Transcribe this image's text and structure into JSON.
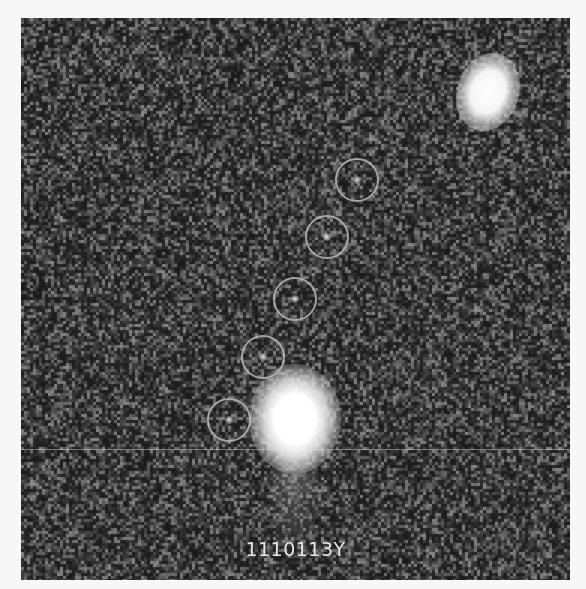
{
  "image": {
    "description": "Astronomical survey cutout showing a faint moving object tracked across five exposures, marked with circles, near a bright star",
    "label": "1110113Y",
    "background_color": "#2a2a2a",
    "border_color": "#f7f7f7",
    "marker_color": "#b9b9b9"
  },
  "markers": [
    {
      "index": 1,
      "cx": 336,
      "cy": 162,
      "r": 22
    },
    {
      "index": 2,
      "cx": 306,
      "cy": 219,
      "r": 22
    },
    {
      "index": 3,
      "cx": 274,
      "cy": 281,
      "r": 22
    },
    {
      "index": 4,
      "cx": 242,
      "cy": 339,
      "r": 22
    },
    {
      "index": 5,
      "cx": 208,
      "cy": 402,
      "r": 22
    }
  ],
  "bright_sources": [
    {
      "name": "bright-star",
      "cx": 274,
      "cy": 392
    },
    {
      "name": "bright-galaxy",
      "cx": 467,
      "cy": 74
    }
  ]
}
